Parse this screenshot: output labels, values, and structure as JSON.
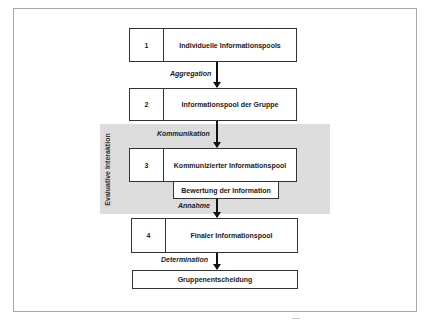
{
  "diagram": {
    "region": {
      "label": "Evaluative Interaktion",
      "color": "#dcdcdc"
    },
    "steps": [
      {
        "number": "1",
        "label": "Individuelle Informationspools"
      },
      {
        "number": "2",
        "label": "Informationspool der Gruppe"
      },
      {
        "number": "3",
        "label": "Kommunizierter Informationspool"
      },
      {
        "number": "4",
        "label": "Finaler Informationspool"
      }
    ],
    "sub_box": "Bewertung der Information",
    "final_box": "Gruppenentscheidung",
    "transitions": [
      {
        "from": "1",
        "to": "2",
        "label": "Aggregation"
      },
      {
        "from": "2",
        "to": "3",
        "label": "Kommunikation"
      },
      {
        "from": "3",
        "to": "4",
        "label": "Annahme"
      },
      {
        "from": "4",
        "to": "final",
        "label": "Determination"
      }
    ]
  }
}
